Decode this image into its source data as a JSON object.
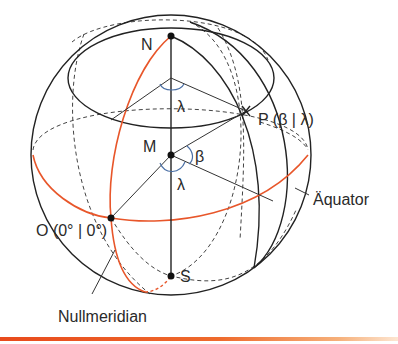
{
  "figure": {
    "labels": {
      "north_pole": "N",
      "south_pole": "S",
      "center": "M",
      "origin": "O (0° | 0°)",
      "point": "P (β | λ)",
      "angle_latitude": "β",
      "angle_longitude_top": "λ",
      "angle_longitude_center": "λ",
      "equator": "Äquator",
      "prime_meridian": "Nullmeridian"
    },
    "colors": {
      "outline": "#222222",
      "highlight": "#e8562a",
      "angle_arc": "#4a6fa5",
      "bottom_bar": "#e84a1c"
    }
  }
}
